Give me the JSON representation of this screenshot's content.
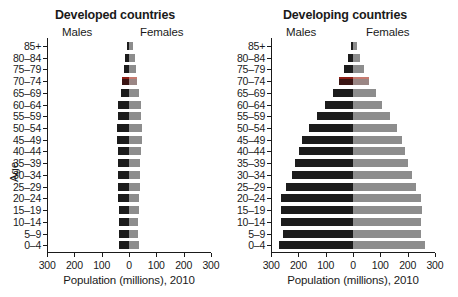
{
  "figure": {
    "xlabel": "Population (millions), 2010",
    "ylabel": "Age"
  },
  "panels": [
    {
      "title": "Developed countries",
      "male_label": "Males",
      "female_label": "Females"
    },
    {
      "title": "Developing countries",
      "male_label": "Males",
      "female_label": "Females"
    }
  ],
  "axis": {
    "ticks": [
      "300",
      "200",
      "100",
      "0",
      "100",
      "200",
      "300"
    ],
    "tick_values": [
      -300,
      -200,
      -100,
      0,
      100,
      200,
      300
    ]
  },
  "age_groups": [
    "85+",
    "80–84",
    "75–79",
    "70–74",
    "65–69",
    "60–64",
    "55–59",
    "50–54",
    "45–49",
    "40–44",
    "35–39",
    "30–34",
    "25–29",
    "20–24",
    "15–19",
    "10–14",
    "5–9",
    "0–4"
  ],
  "colors": {
    "male": "#1c1c1c",
    "female": "#8d8d8d",
    "highlight": "#8e1f16",
    "axis": "#1a1a1a",
    "background": "#ffffff"
  },
  "chart_data": [
    {
      "type": "bar",
      "title": "Developed countries",
      "subtype": "population-pyramid",
      "xlabel": "Population (millions), 2010",
      "ylabel": "Age",
      "categories": [
        "85+",
        "80–84",
        "75–79",
        "70–74",
        "65–69",
        "60–64",
        "55–59",
        "50–54",
        "45–49",
        "40–44",
        "35–39",
        "30–34",
        "25–29",
        "20–24",
        "15–19",
        "10–14",
        "5–9",
        "0–4"
      ],
      "series": [
        {
          "name": "Males",
          "direction": "left",
          "values": [
            7,
            13,
            19,
            24,
            30,
            39,
            42,
            45,
            45,
            42,
            41,
            41,
            41,
            39,
            38,
            36,
            36,
            37
          ]
        },
        {
          "name": "Females",
          "direction": "right",
          "values": [
            16,
            23,
            27,
            30,
            35,
            43,
            45,
            47,
            46,
            43,
            41,
            41,
            40,
            38,
            36,
            34,
            34,
            35
          ]
        }
      ],
      "xlim": [
        -300,
        300
      ],
      "grid": false,
      "legend": "inline-headers",
      "highlight_row": "70–74"
    },
    {
      "type": "bar",
      "title": "Developing countries",
      "subtype": "population-pyramid",
      "xlabel": "Population (millions), 2010",
      "ylabel": "Age",
      "categories": [
        "85+",
        "80–84",
        "75–79",
        "70–74",
        "65–69",
        "60–64",
        "55–59",
        "50–54",
        "45–49",
        "40–44",
        "35–39",
        "30–34",
        "25–29",
        "20–24",
        "15–19",
        "10–14",
        "5–9",
        "0–4"
      ],
      "series": [
        {
          "name": "Males",
          "direction": "left",
          "values": [
            9,
            18,
            33,
            52,
            75,
            102,
            131,
            160,
            186,
            198,
            212,
            225,
            245,
            262,
            265,
            263,
            258,
            270
          ]
        },
        {
          "name": "Females",
          "direction": "right",
          "values": [
            14,
            25,
            42,
            60,
            83,
            108,
            135,
            162,
            180,
            190,
            203,
            215,
            232,
            250,
            252,
            250,
            248,
            262
          ]
        }
      ],
      "xlim": [
        -300,
        300
      ],
      "grid": false,
      "legend": "inline-headers",
      "highlight_row": "70–74"
    }
  ]
}
